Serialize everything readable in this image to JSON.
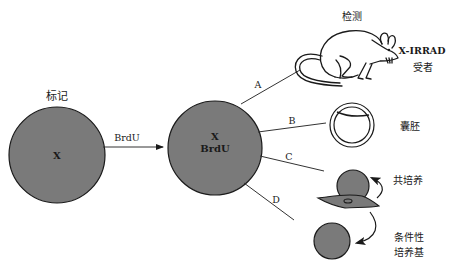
{
  "colors": {
    "cell_fill": "#7a7a7a",
    "stroke": "#1a1a1a",
    "background": "#ffffff"
  },
  "source_cell": {
    "title": "标记",
    "label": "X"
  },
  "arrow": {
    "label": "BrdU"
  },
  "labeled_cell": {
    "line1": "X",
    "line2": "BrdU"
  },
  "branches": [
    {
      "letter": "A",
      "target": "mouse"
    },
    {
      "letter": "B",
      "target": "blastocyst"
    },
    {
      "letter": "C",
      "target": "coculture"
    },
    {
      "letter": "D",
      "target": "conditioned-medium"
    }
  ],
  "mouse": {
    "title": "检测",
    "label_line1": "X-IRRAD",
    "label_line2": "受者",
    "icon": "mouse-icon"
  },
  "blastocyst": {
    "label": "囊胚",
    "icon": "blastocyst-icon"
  },
  "coculture": {
    "label": "共培养",
    "icon": "cell-icon"
  },
  "conditioned_medium": {
    "label_line1": "条件性",
    "label_line2": "培养基",
    "icon": "cell-icon"
  },
  "feeder": {
    "icon": "fibroblast-icon"
  }
}
